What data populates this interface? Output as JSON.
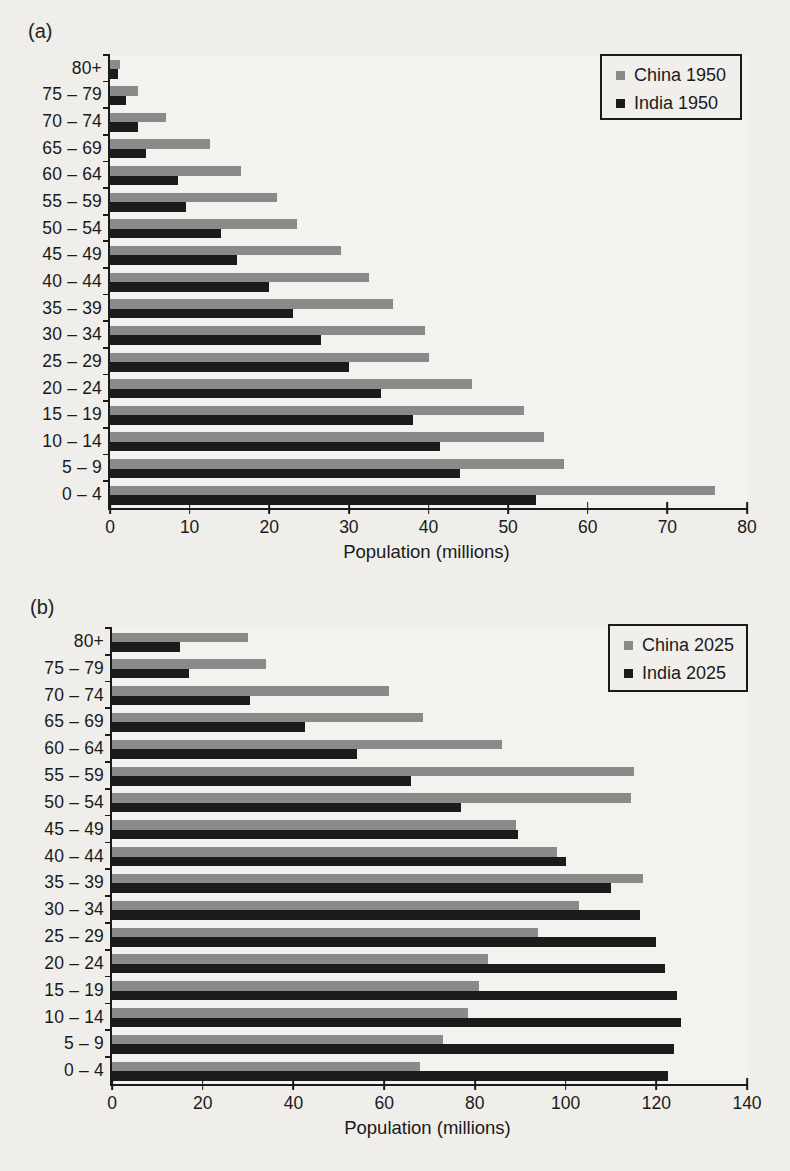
{
  "page": {
    "background_color": "#efeeeb",
    "text_color": "#1a1a1a"
  },
  "chart_data": [
    {
      "type": "bar",
      "orientation": "horizontal",
      "panel_label": "(a)",
      "xlabel": "Population (millions)",
      "xlim": [
        0,
        80
      ],
      "x_ticks": [
        0,
        10,
        20,
        30,
        40,
        50,
        60,
        70,
        80
      ],
      "grid": false,
      "legend_position": "top-right",
      "categories": [
        "80+",
        "75 – 79",
        "70 – 74",
        "65 – 69",
        "60 – 64",
        "55 – 59",
        "50 – 54",
        "45 – 49",
        "40 – 44",
        "35 – 39",
        "30 – 34",
        "25 – 29",
        "20 – 24",
        "15 – 19",
        "10 – 14",
        "5 – 9",
        "0 – 4"
      ],
      "series": [
        {
          "name": "China 1950",
          "color": "#8a8a8a",
          "values": [
            1.3,
            3.5,
            7,
            12.5,
            16.5,
            21,
            23.5,
            29,
            32.5,
            35.5,
            39.5,
            40,
            45.5,
            52,
            54.5,
            57,
            76
          ]
        },
        {
          "name": "India 1950",
          "color": "#1b1b1b",
          "values": [
            1,
            2,
            3.5,
            4.5,
            8.5,
            9.5,
            14,
            16,
            20,
            23,
            26.5,
            30,
            34,
            38,
            41.5,
            44,
            53.5
          ]
        }
      ]
    },
    {
      "type": "bar",
      "orientation": "horizontal",
      "panel_label": "(b)",
      "xlabel": "Population (millions)",
      "xlim": [
        0,
        140
      ],
      "x_ticks": [
        0,
        20,
        40,
        60,
        80,
        100,
        120,
        140
      ],
      "grid": false,
      "legend_position": "top-right",
      "categories": [
        "80+",
        "75 – 79",
        "70 – 74",
        "65 – 69",
        "60 – 64",
        "55 – 59",
        "50 – 54",
        "45 – 49",
        "40 – 44",
        "35 – 39",
        "30 – 34",
        "25 – 29",
        "20 – 24",
        "15 – 19",
        "10 – 14",
        "5 – 9",
        "0 – 4"
      ],
      "series": [
        {
          "name": "China 2025",
          "color": "#8a8a8a",
          "values": [
            30,
            34,
            61,
            68.5,
            86,
            115,
            114.5,
            89,
            98,
            117,
            103,
            94,
            83,
            81,
            78.5,
            73,
            68
          ]
        },
        {
          "name": "India 2025",
          "color": "#1b1b1b",
          "values": [
            15,
            17,
            30.5,
            42.5,
            54,
            66,
            77,
            89.5,
            100,
            110,
            116.5,
            120,
            122,
            124.5,
            125.5,
            124,
            122.5
          ]
        }
      ]
    }
  ]
}
